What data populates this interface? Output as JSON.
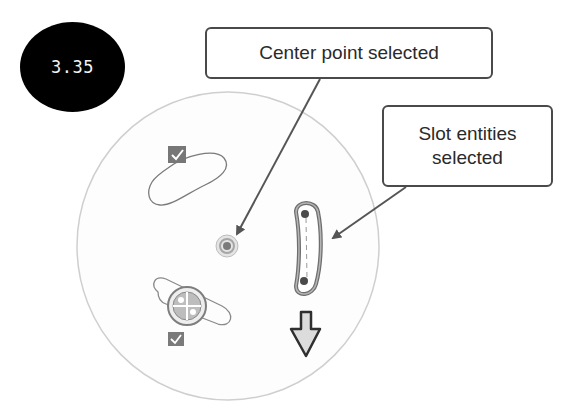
{
  "step": {
    "number": "3.35"
  },
  "callouts": {
    "center_point": {
      "text": "Center point selected"
    },
    "slot_entities": {
      "line1": "Slot entities",
      "line2": "selected"
    }
  },
  "sketch": {
    "elements": [
      {
        "type": "circle-boundary",
        "description": "large construction circle"
      },
      {
        "type": "slot",
        "position": "upper-left",
        "selected": false,
        "has_checkbox": true
      },
      {
        "type": "center-point",
        "selected": true
      },
      {
        "type": "curved-slot",
        "position": "right",
        "selected": true
      },
      {
        "type": "slot",
        "position": "lower-left",
        "selected": false,
        "has_checkbox": true,
        "has_rotate_handle": true
      },
      {
        "type": "direction-arrow",
        "direction": "down"
      }
    ]
  },
  "colors": {
    "badge_bg": "#000000",
    "badge_text": "#f2f2f2",
    "callout_border": "#4a4a4a",
    "callout_text": "#2a2a2a",
    "circle_stroke": "#c8c8c8",
    "sketch_line": "#777777",
    "selected_highlight": "#6e6e6e",
    "arrow": "#555555"
  }
}
